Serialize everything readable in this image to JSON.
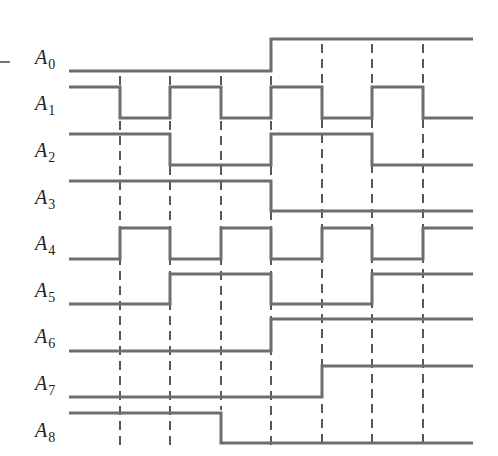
{
  "diagram": {
    "type": "timing-diagram",
    "x_start": 69,
    "x_end": 473,
    "transition_x": [
      120,
      170,
      221,
      271,
      322,
      372,
      423
    ],
    "dashed_lines": [
      {
        "x": 120,
        "y1": 76,
        "y2": 446
      },
      {
        "x": 170,
        "y1": 76,
        "y2": 446
      },
      {
        "x": 221,
        "y1": 76,
        "y2": 410
      },
      {
        "x": 271,
        "y1": 76,
        "y2": 446
      },
      {
        "x": 322,
        "y1": 44,
        "y2": 446
      },
      {
        "x": 372,
        "y1": 44,
        "y2": 446
      },
      {
        "x": 423,
        "y1": 44,
        "y2": 446
      }
    ],
    "signals": [
      {
        "name": "A",
        "sub": "0",
        "label_y": 64,
        "high_y": 39,
        "low_y": 71,
        "levels": [
          0,
          0,
          0,
          0,
          1,
          1,
          1,
          1
        ]
      },
      {
        "name": "A",
        "sub": "1",
        "label_y": 110,
        "high_y": 87,
        "low_y": 118,
        "levels": [
          1,
          0,
          1,
          0,
          1,
          0,
          1,
          0
        ]
      },
      {
        "name": "A",
        "sub": "2",
        "label_y": 157,
        "high_y": 134,
        "low_y": 165,
        "levels": [
          1,
          1,
          0,
          0,
          1,
          1,
          0,
          0
        ]
      },
      {
        "name": "A",
        "sub": "3",
        "label_y": 204,
        "high_y": 181,
        "low_y": 211,
        "levels": [
          1,
          1,
          1,
          1,
          0,
          0,
          0,
          0
        ]
      },
      {
        "name": "A",
        "sub": "4",
        "label_y": 250,
        "high_y": 228,
        "low_y": 259,
        "levels": [
          0,
          1,
          0,
          1,
          0,
          1,
          0,
          1
        ]
      },
      {
        "name": "A",
        "sub": "5",
        "label_y": 297,
        "high_y": 274,
        "low_y": 304,
        "levels": [
          0,
          0,
          1,
          1,
          0,
          0,
          1,
          1
        ]
      },
      {
        "name": "A",
        "sub": "6",
        "label_y": 343,
        "high_y": 319,
        "low_y": 351,
        "levels": [
          0,
          0,
          0,
          0,
          1,
          1,
          1,
          1
        ]
      },
      {
        "name": "A",
        "sub": "7",
        "label_y": 390,
        "high_y": 366,
        "low_y": 397,
        "levels": [
          0,
          0,
          0,
          0,
          0,
          1,
          1,
          1
        ]
      },
      {
        "name": "A",
        "sub": "8",
        "label_y": 437,
        "high_y": 413,
        "low_y": 443,
        "levels": [
          1,
          1,
          1,
          0,
          0,
          0,
          0,
          0
        ]
      }
    ],
    "colors": {
      "signal": "#6e6e6e",
      "dash": "#222222",
      "label": "#222222"
    }
  }
}
